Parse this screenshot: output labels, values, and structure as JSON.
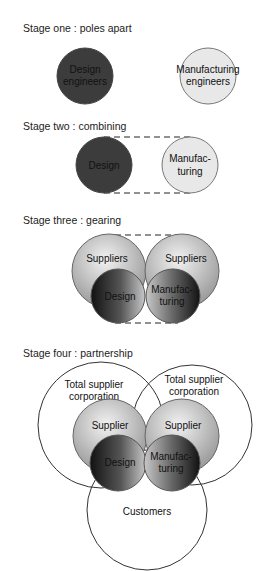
{
  "stages": [
    {
      "title": "Stage one : poles apart",
      "labels": {
        "design_1": "Design",
        "design_2": "engineers",
        "manu_1": "Manufacturing",
        "manu_2": "engineers"
      }
    },
    {
      "title": "Stage two : combining",
      "labels": {
        "design": "Design",
        "manu_1": "Manufac-",
        "manu_2": "turing"
      }
    },
    {
      "title": "Stage three : gearing",
      "labels": {
        "suppliers_left": "Suppliers",
        "suppliers_right": "Suppliers",
        "design": "Design",
        "manu_1": "Manufac-",
        "manu_2": "turing"
      }
    },
    {
      "title": "Stage four : partnership",
      "labels": {
        "tsc_left_1": "Total supplier",
        "tsc_left_2": "corporation",
        "tsc_right_1": "Total supplier",
        "tsc_right_2": "corporation",
        "supplier_left": "Supplier",
        "supplier_right": "Supplier",
        "design": "Design",
        "manu_1": "Manufac-",
        "manu_2": "turing",
        "customers": "Customers"
      }
    }
  ],
  "colors": {
    "dark": "#3a3a3a",
    "light": "#e6e6e6",
    "mid": "#b8b8b8",
    "stroke": "#555555"
  }
}
